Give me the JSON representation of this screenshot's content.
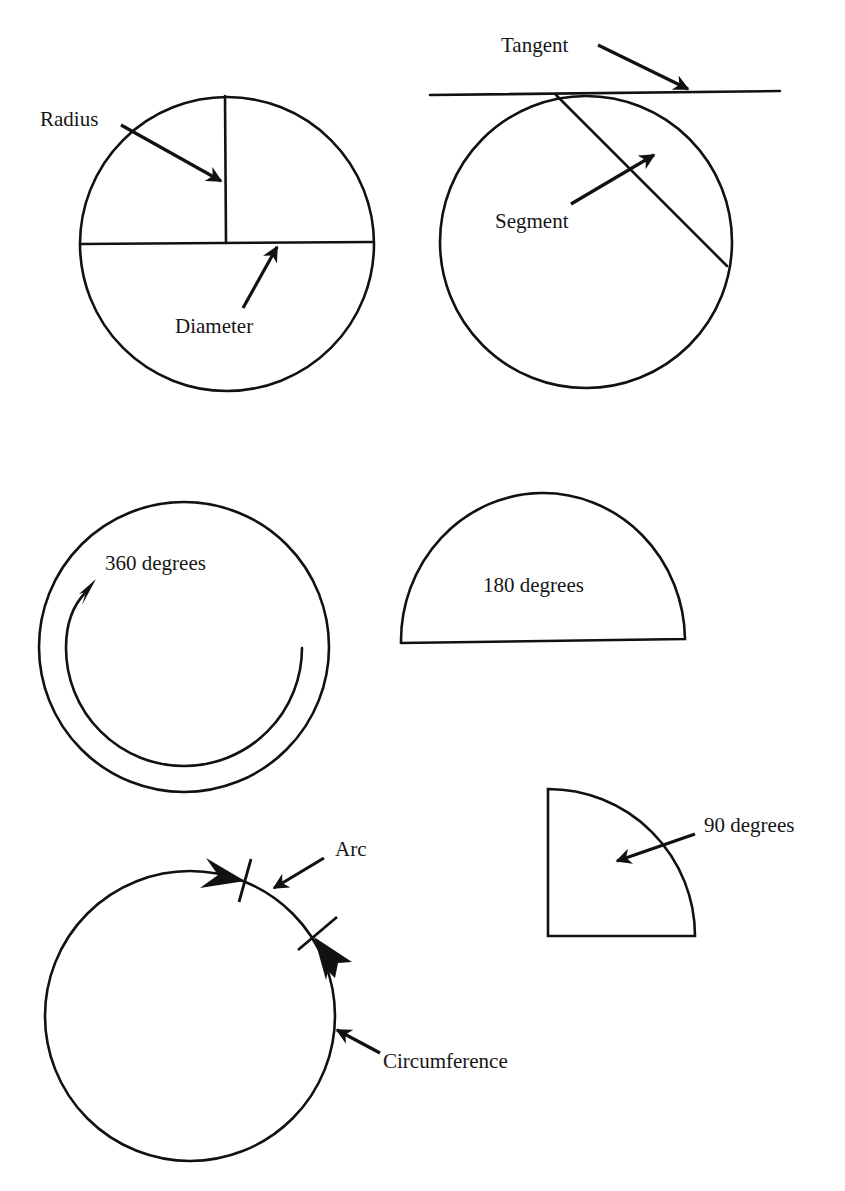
{
  "diagram": {
    "colors": {
      "ink": "#111111",
      "background": "#ffffff"
    },
    "figures": [
      {
        "id": "radius-diameter",
        "labels": {
          "radius": "Radius",
          "diameter": "Diameter"
        }
      },
      {
        "id": "tangent-segment",
        "labels": {
          "tangent": "Tangent",
          "segment": "Segment"
        }
      },
      {
        "id": "full-circle",
        "labels": {
          "degrees": "360 degrees"
        }
      },
      {
        "id": "semicircle",
        "labels": {
          "degrees": "180 degrees"
        }
      },
      {
        "id": "arc-circumference",
        "labels": {
          "arc": "Arc",
          "circumference": "Circumference"
        }
      },
      {
        "id": "quarter-circle",
        "labels": {
          "degrees": "90 degrees"
        }
      }
    ]
  }
}
